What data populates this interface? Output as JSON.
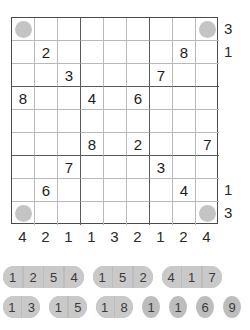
{
  "puzzle": {
    "type": "sudoku-variant-grid",
    "size": 9,
    "grid_rows": [
      [
        "circle",
        "",
        "",
        "",
        "",
        "",
        "",
        "",
        "circle"
      ],
      [
        "",
        "2",
        "",
        "",
        "",
        "",
        "",
        "8",
        ""
      ],
      [
        "",
        "",
        "3",
        "",
        "",
        "",
        "7",
        "",
        ""
      ],
      [
        "8",
        "",
        "",
        "4",
        "",
        "6",
        "",
        "",
        ""
      ],
      [
        "",
        "",
        "",
        "",
        "",
        "",
        "",
        "",
        ""
      ],
      [
        "",
        "",
        "",
        "8",
        "",
        "2",
        "",
        "",
        "7"
      ],
      [
        "",
        "",
        "7",
        "",
        "",
        "",
        "3",
        "",
        ""
      ],
      [
        "",
        "6",
        "",
        "",
        "",
        "",
        "",
        "4",
        ""
      ],
      [
        "circle",
        "",
        "",
        "",
        "",
        "",
        "",
        "",
        "circle"
      ]
    ],
    "clues_right": {
      "top": [
        "3",
        "1"
      ],
      "bottom": [
        "1",
        "3"
      ]
    },
    "clues_bottom": [
      "4",
      "2",
      "1",
      "1",
      "3",
      "2",
      "1",
      "2",
      "4"
    ],
    "pill_rows": [
      [
        {
          "digits": [
            "1",
            "2",
            "5",
            "4"
          ]
        },
        {
          "digits": [
            "1",
            "5",
            "2"
          ]
        },
        {
          "digits": [
            "4",
            "1",
            "7"
          ]
        }
      ],
      [
        {
          "digits": [
            "1",
            "3"
          ]
        },
        {
          "digits": [
            "1",
            "5"
          ]
        },
        {
          "digits": [
            "1",
            "8"
          ]
        },
        {
          "digits": [
            "1"
          ]
        },
        {
          "digits": [
            "1"
          ]
        },
        {
          "digits": [
            "6"
          ]
        },
        {
          "digits": [
            "9"
          ]
        }
      ]
    ],
    "colors": {
      "disc": "#c4c4c4",
      "pill": "#c9c9c9",
      "grid_line": "#b9b9b9",
      "grid_border": "#4a4a4a"
    }
  }
}
